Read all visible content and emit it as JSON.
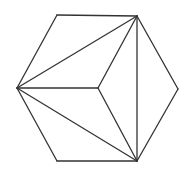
{
  "diagram": {
    "title": "",
    "stroke_color": "#333333",
    "background": "#ffffff",
    "stroke_width": 1.3,
    "vertices": {
      "left": [
        17,
        88
      ],
      "top_left": [
        57,
        15
      ],
      "top_right": [
        137,
        16
      ],
      "right": [
        178,
        89
      ],
      "bottom_right": [
        137,
        161
      ],
      "bottom_left": [
        57,
        161
      ],
      "center": [
        98,
        88
      ]
    },
    "edges": [
      {
        "name": "hex-edge-left-topleft",
        "from": "left",
        "to": "top_left"
      },
      {
        "name": "hex-edge-topleft-topright",
        "from": "top_left",
        "to": "top_right"
      },
      {
        "name": "hex-edge-topright-right",
        "from": "top_right",
        "to": "right"
      },
      {
        "name": "hex-edge-right-bottomright",
        "from": "right",
        "to": "bottom_right"
      },
      {
        "name": "hex-edge-bottomright-bottomleft",
        "from": "bottom_right",
        "to": "bottom_left"
      },
      {
        "name": "hex-edge-bottomleft-left",
        "from": "bottom_left",
        "to": "left"
      },
      {
        "name": "diagonal-left-topright",
        "from": "left",
        "to": "top_right"
      },
      {
        "name": "diagonal-left-bottomright",
        "from": "left",
        "to": "bottom_right"
      },
      {
        "name": "inner-left-center",
        "from": "left",
        "to": "center"
      },
      {
        "name": "inner-center-topright",
        "from": "center",
        "to": "top_right"
      },
      {
        "name": "inner-center-bottomright",
        "from": "center",
        "to": "bottom_right"
      },
      {
        "name": "vertical-topright-bottomright",
        "from": "top_right",
        "to": "bottom_right"
      }
    ]
  }
}
